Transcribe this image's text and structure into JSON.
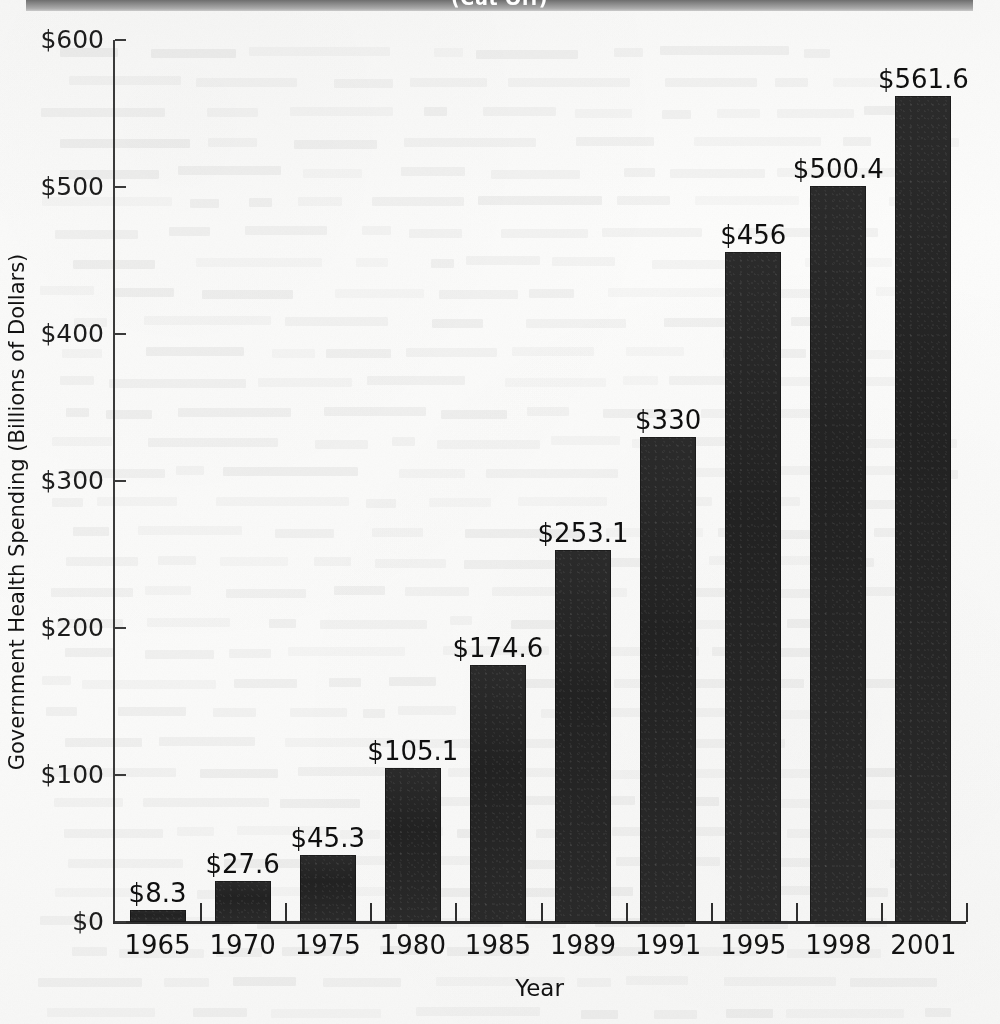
{
  "title_band": {
    "text": "(Cut Off)",
    "visible_fragment": "(cut off at top of page)"
  },
  "axes": {
    "ylabel": "Government Health Spending (Billions of Dollars)",
    "xlabel": "Year",
    "yticks": [
      "$0",
      "$100",
      "$200",
      "$300",
      "$400",
      "$500",
      "$600"
    ]
  },
  "chart_data": {
    "type": "bar",
    "title": "",
    "xlabel": "Year",
    "ylabel": "Government Health Spending (Billions of Dollars)",
    "categories": [
      "1965",
      "1970",
      "1975",
      "1980",
      "1985",
      "1989",
      "1991",
      "1995",
      "1998",
      "2001"
    ],
    "values": [
      8.3,
      27.6,
      45.3,
      105.1,
      174.6,
      253.1,
      330,
      456,
      500.4,
      561.6
    ],
    "value_labels": [
      "$8.3",
      "$27.6",
      "$45.3",
      "$105.1",
      "$174.6",
      "$253.1",
      "$330",
      "$456",
      "$500.4",
      "$561.6"
    ],
    "ylim": [
      0,
      600
    ],
    "ytick_values": [
      0,
      100,
      200,
      300,
      400,
      500,
      600
    ],
    "ytick_labels": [
      "$0",
      "$100",
      "$200",
      "$300",
      "$400",
      "$500",
      "$600"
    ],
    "grid": false,
    "legend": "none",
    "bar_color": "#262626",
    "units": "Billions of Dollars"
  }
}
